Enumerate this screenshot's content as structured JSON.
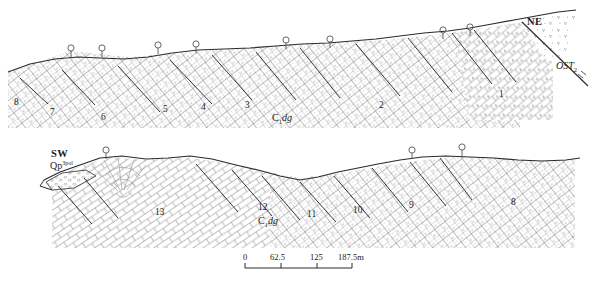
{
  "figure": {
    "type": "geological-cross-section",
    "background_color": "#ffffff",
    "line_color": "#2b2b2b",
    "hatch_color": "#6f6f6f"
  },
  "upper_section": {
    "direction_label_right": "NE",
    "stratigraphic_label_right": {
      "main": "OST",
      "subscript": "2"
    },
    "formation_label": {
      "main": "C",
      "subscript": "1",
      "italic": "dg"
    },
    "block_numbers": [
      "8",
      "7",
      "6",
      "5",
      "4",
      "3",
      "2",
      "1"
    ],
    "borehole_count": 8
  },
  "lower_section": {
    "direction_label_left": "SW",
    "quaternary_label": {
      "main": "Qp",
      "superscript": "3pol"
    },
    "formation_label": {
      "main": "C",
      "subscript": "1",
      "italic": "dg"
    },
    "block_numbers": [
      "13",
      "12",
      "11",
      "10",
      "9",
      "8"
    ],
    "borehole_count": 3
  },
  "scale_bar": {
    "ticks": [
      "0",
      "62.5",
      "125",
      "187.5m"
    ],
    "unit": "m",
    "max_value": 187.5
  }
}
